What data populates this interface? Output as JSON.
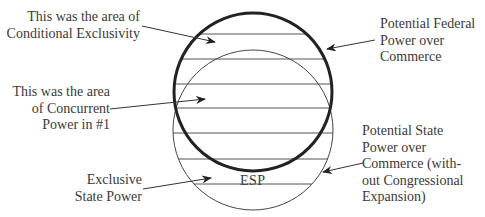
{
  "diagram": {
    "type": "overlapping-circles",
    "bold_circle": {
      "cx": 253,
      "cy": 92,
      "r": 79,
      "stroke": "#222222",
      "stroke_width": 3,
      "meaning": "Potential Federal Power over Commerce"
    },
    "thin_circle": {
      "cx": 253,
      "cy": 130,
      "r": 80,
      "stroke": "#444444",
      "stroke_width": 1
    },
    "hatch_lines_y": [
      34,
      59,
      84,
      108,
      133,
      159,
      184
    ],
    "center_label": "ESP"
  },
  "labels": {
    "conditional_exclusivity": [
      "This was the area of",
      "Conditional Exclusivity"
    ],
    "concurrent_power": [
      "This was the area",
      "of Concurrent",
      "Power in #1"
    ],
    "exclusive_state": [
      "Exclusive",
      "State Power"
    ],
    "federal_power": [
      "Potential Federal",
      "Power over",
      "Commerce"
    ],
    "state_power": [
      "Potential State",
      "Power over",
      "Commerce (with-",
      "out Congressional",
      "Expansion)"
    ]
  }
}
